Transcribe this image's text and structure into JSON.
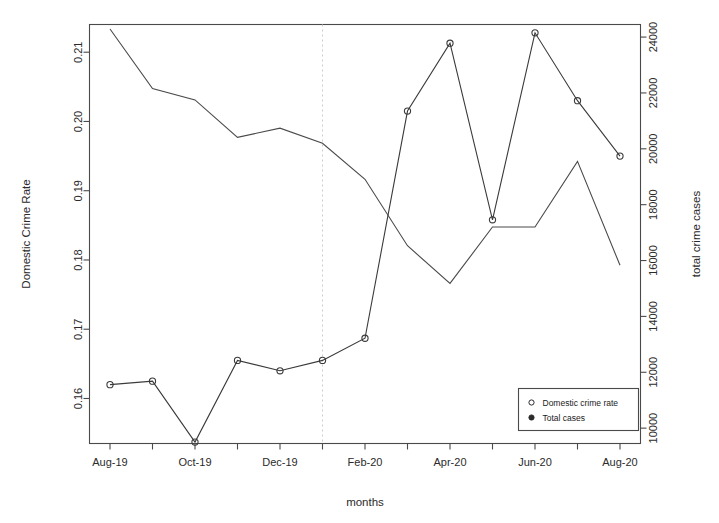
{
  "chart_data": {
    "type": "line",
    "title": "",
    "xlabel": "months",
    "ylabel": "Domestic Crime Rate",
    "y2label": "total crime cases",
    "grid": false,
    "legend_position": "bottom-right",
    "x": [
      "Aug-19",
      "Sep-19",
      "Oct-19",
      "Nov-19",
      "Dec-19",
      "Jan-20",
      "Feb-20",
      "Mar-20",
      "Apr-20",
      "May-20",
      "Jun-20",
      "Jul-20",
      "Aug-20"
    ],
    "xtick_labels": [
      "Aug-19",
      "",
      "Oct-19",
      "",
      "Dec-19",
      "",
      "Feb-20",
      "",
      "Apr-20",
      "",
      "Jun-20",
      "",
      "Aug-20"
    ],
    "xtick_labels_shown": [
      "Aug-19",
      "Oct-19",
      "Dec-19",
      "Feb-20",
      "Apr-20",
      "Jun-20",
      "Aug-20"
    ],
    "ylim": [
      0.1535,
      0.214
    ],
    "ytick_labels": [
      "0.16",
      "0.17",
      "0.18",
      "0.19",
      "0.20",
      "0.21"
    ],
    "yticks": [
      0.16,
      0.17,
      0.18,
      0.19,
      0.2,
      0.21
    ],
    "y2lim": [
      9450,
      24450
    ],
    "y2tick_labels": [
      "10000",
      "12000",
      "14000",
      "16000",
      "18000",
      "20000",
      "22000",
      "24000"
    ],
    "y2ticks": [
      10000,
      12000,
      14000,
      16000,
      18000,
      20000,
      22000,
      24000
    ],
    "annotations": [
      {
        "type": "vertical-dashed-line",
        "x": "Jan-20",
        "label": ""
      }
    ],
    "series": [
      {
        "name": "Domestic crime rate",
        "axis": "left",
        "marker": "open-circle",
        "color": "#3a3a3a",
        "values": [
          0.162,
          0.1625,
          0.1537,
          0.1655,
          0.164,
          0.1655,
          0.1687,
          0.2015,
          0.2113,
          0.1858,
          0.2128,
          0.203,
          0.195
        ]
      },
      {
        "name": "Total cases",
        "axis": "right",
        "marker": "none",
        "color": "#4a4a4a",
        "values": [
          24290,
          22160,
          21750,
          20410,
          20740,
          20200,
          18910,
          16530,
          15180,
          17200,
          17200,
          19550,
          15830
        ]
      }
    ],
    "legend": [
      {
        "label": "Domestic crime rate",
        "marker": "open-circle"
      },
      {
        "label": "Total cases",
        "marker": "filled-circle"
      }
    ]
  }
}
